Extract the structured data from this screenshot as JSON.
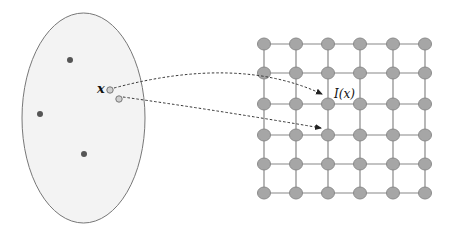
{
  "diagram": {
    "type": "mapping-to-lattice",
    "colors": {
      "ellipse_fill": "#f3f3f3",
      "ellipse_stroke": "#777777",
      "dark_dot": "#555555",
      "light_dot_fill": "#cfcfcf",
      "light_dot_stroke": "#777777",
      "node_fill": "#a6a6a6",
      "node_stroke": "#8a8a8a",
      "grid_line": "#888888",
      "arrow": "#333333"
    },
    "input_space": {
      "shape": "ellipse",
      "cx": 83.5,
      "cy": 118,
      "rx": 61.5,
      "ry": 105,
      "data_points": [
        {
          "x": 70,
          "y": 60
        },
        {
          "x": 40,
          "y": 114
        },
        {
          "x": 84,
          "y": 154
        }
      ],
      "query_points": [
        {
          "x": 110,
          "y": 90,
          "label": "x"
        },
        {
          "x": 119,
          "y": 99,
          "label": ""
        }
      ]
    },
    "lattice": {
      "cols": [
        264,
        296,
        328,
        360,
        393,
        425
      ],
      "rows": [
        44,
        73,
        104,
        135,
        164,
        193
      ],
      "node_rx": 6.5,
      "node_ry": 6
    },
    "mappings": [
      {
        "from": {
          "x": 110,
          "y": 90
        },
        "to": {
          "x": 326,
          "y": 98
        },
        "label": "I(x)"
      },
      {
        "from": {
          "x": 119,
          "y": 99
        },
        "to": {
          "x": 325,
          "y": 132
        },
        "label": ""
      }
    ],
    "labels": {
      "x_label": "x",
      "image_label": "I(x)"
    }
  }
}
